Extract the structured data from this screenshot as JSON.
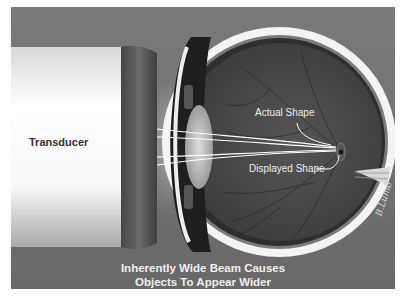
{
  "diagram": {
    "labels": {
      "transducer": "Transducer",
      "actual_shape": "Actual Shape",
      "displayed_shape": "Displayed Shape"
    },
    "caption": {
      "line1": "Inherently Wide Beam Causes",
      "line2": "Objects To Appear Wider"
    },
    "signature": "B.Lumb",
    "colors": {
      "background": "#6e6e6e",
      "transducer_body": "#f4f4f4",
      "transducer_cap": "#555555",
      "sclera": "#f5f5f5",
      "retina_interior": "#4a4a4a",
      "beam_lines": "#ffffff"
    }
  }
}
